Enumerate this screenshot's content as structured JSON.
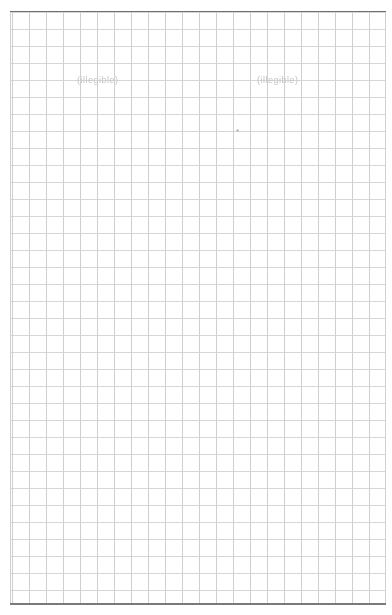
{
  "page": {
    "type": "grid-paper",
    "grid_spacing_px": 17,
    "colors": {
      "background": "#ffffff",
      "grid_line": "#d2d2d2",
      "border": "#6e6e6e",
      "faint_text": "#c4c4c4"
    }
  },
  "labels": {
    "left": "(illegible)",
    "right": "(illegible)",
    "mark": "*"
  }
}
